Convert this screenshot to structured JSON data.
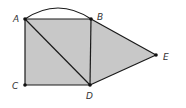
{
  "diagram": {
    "type": "geometry",
    "colors": {
      "fill": "#c8c8c8",
      "stroke": "#1a1a1a",
      "point": "#111111",
      "label": "#333333"
    },
    "points": {
      "A": {
        "label": "A",
        "x": 25,
        "y": 19
      },
      "B": {
        "label": "B",
        "x": 91,
        "y": 19
      },
      "C": {
        "label": "C",
        "x": 25,
        "y": 85
      },
      "D": {
        "label": "D",
        "x": 90,
        "y": 85
      },
      "E": {
        "label": "E",
        "x": 156,
        "y": 55
      }
    },
    "segments": [
      "AB",
      "AC",
      "CD",
      "BD",
      "AD",
      "BE",
      "DE"
    ],
    "arcs": [
      "AB (arc above segment AB)"
    ],
    "shaded_regions": [
      "square ABDC",
      "triangle BDE"
    ]
  }
}
